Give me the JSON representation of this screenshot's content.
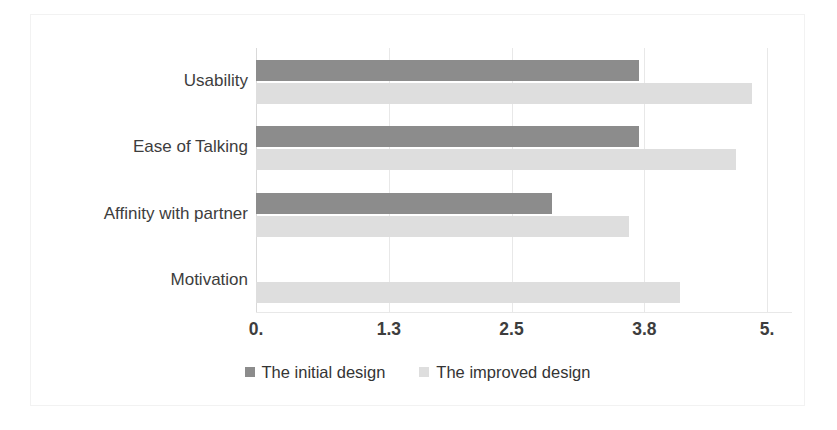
{
  "chart_data": {
    "type": "bar",
    "orientation": "horizontal",
    "title": "",
    "subtitle": "",
    "xlabel": "",
    "ylabel": "",
    "categories": [
      "Usability",
      "Ease of Talking",
      "Affinity with partner",
      "Motivation"
    ],
    "series": [
      {
        "name": "The initial design",
        "color": "#8c8c8c",
        "values": [
          3.75,
          3.75,
          2.9,
          0
        ]
      },
      {
        "name": "The improved design",
        "color": "#dedede",
        "values": [
          4.85,
          4.7,
          3.65,
          4.15
        ]
      }
    ],
    "xlim": [
      0,
      5
    ],
    "xticks": [
      0,
      1.3,
      2.5,
      3.8,
      5
    ],
    "xtick_labels": [
      "0.",
      "1.3",
      "2.5",
      "3.8",
      "5."
    ],
    "grid": "vertical",
    "legend_position": "bottom"
  },
  "colors": {
    "series_initial": "#8c8c8c",
    "series_improved": "#dedede",
    "gridline": "#e8e8e8",
    "frame_border": "#f2f2f2",
    "text": "#3d3d3d",
    "background": "#ffffff"
  }
}
